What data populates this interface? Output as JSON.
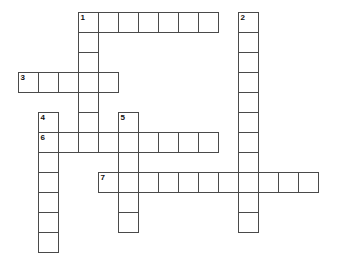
{
  "puzzle": {
    "title": "Crossword Puzzle Grid",
    "cell_size": 20,
    "origin_x": 18,
    "origin_y": 12,
    "grid_columns": 16,
    "grid_rows": 12,
    "border_color": "#4a4a4a",
    "cell_fill": "#ffffff",
    "number_color": "#111111",
    "background": "#ffffff",
    "entries": [
      {
        "number": "1",
        "direction": "across",
        "start_col": 3,
        "start_row": 0,
        "length": 7
      },
      {
        "number": "1",
        "direction": "down",
        "start_col": 3,
        "start_row": 0,
        "length": 7
      },
      {
        "number": "2",
        "direction": "down",
        "start_col": 11,
        "start_row": 0,
        "length": 11
      },
      {
        "number": "3",
        "direction": "across",
        "start_col": 0,
        "start_row": 3,
        "length": 5
      },
      {
        "number": "4",
        "direction": "down",
        "start_col": 1,
        "start_row": 5,
        "length": 7
      },
      {
        "number": "5",
        "direction": "down",
        "start_col": 5,
        "start_row": 5,
        "length": 6
      },
      {
        "number": "6",
        "direction": "across",
        "start_col": 1,
        "start_row": 6,
        "length": 9
      },
      {
        "number": "7",
        "direction": "across",
        "start_col": 4,
        "start_row": 8,
        "length": 11
      }
    ],
    "cells": [
      {
        "col": 3,
        "row": 0,
        "number": "1"
      },
      {
        "col": 4,
        "row": 0,
        "number": ""
      },
      {
        "col": 5,
        "row": 0,
        "number": ""
      },
      {
        "col": 6,
        "row": 0,
        "number": ""
      },
      {
        "col": 7,
        "row": 0,
        "number": ""
      },
      {
        "col": 8,
        "row": 0,
        "number": ""
      },
      {
        "col": 9,
        "row": 0,
        "number": ""
      },
      {
        "col": 11,
        "row": 0,
        "number": "2"
      },
      {
        "col": 3,
        "row": 1,
        "number": ""
      },
      {
        "col": 11,
        "row": 1,
        "number": ""
      },
      {
        "col": 3,
        "row": 2,
        "number": ""
      },
      {
        "col": 11,
        "row": 2,
        "number": ""
      },
      {
        "col": 0,
        "row": 3,
        "number": "3"
      },
      {
        "col": 1,
        "row": 3,
        "number": ""
      },
      {
        "col": 2,
        "row": 3,
        "number": ""
      },
      {
        "col": 3,
        "row": 3,
        "number": ""
      },
      {
        "col": 4,
        "row": 3,
        "number": ""
      },
      {
        "col": 11,
        "row": 3,
        "number": ""
      },
      {
        "col": 3,
        "row": 4,
        "number": ""
      },
      {
        "col": 11,
        "row": 4,
        "number": ""
      },
      {
        "col": 1,
        "row": 5,
        "number": "4"
      },
      {
        "col": 3,
        "row": 5,
        "number": ""
      },
      {
        "col": 5,
        "row": 5,
        "number": "5"
      },
      {
        "col": 11,
        "row": 5,
        "number": ""
      },
      {
        "col": 1,
        "row": 6,
        "number": "6"
      },
      {
        "col": 2,
        "row": 6,
        "number": ""
      },
      {
        "col": 3,
        "row": 6,
        "number": ""
      },
      {
        "col": 4,
        "row": 6,
        "number": ""
      },
      {
        "col": 5,
        "row": 6,
        "number": ""
      },
      {
        "col": 6,
        "row": 6,
        "number": ""
      },
      {
        "col": 7,
        "row": 6,
        "number": ""
      },
      {
        "col": 8,
        "row": 6,
        "number": ""
      },
      {
        "col": 9,
        "row": 6,
        "number": ""
      },
      {
        "col": 11,
        "row": 6,
        "number": ""
      },
      {
        "col": 1,
        "row": 7,
        "number": ""
      },
      {
        "col": 5,
        "row": 7,
        "number": ""
      },
      {
        "col": 11,
        "row": 7,
        "number": ""
      },
      {
        "col": 1,
        "row": 8,
        "number": ""
      },
      {
        "col": 4,
        "row": 8,
        "number": "7"
      },
      {
        "col": 5,
        "row": 8,
        "number": ""
      },
      {
        "col": 6,
        "row": 8,
        "number": ""
      },
      {
        "col": 7,
        "row": 8,
        "number": ""
      },
      {
        "col": 8,
        "row": 8,
        "number": ""
      },
      {
        "col": 9,
        "row": 8,
        "number": ""
      },
      {
        "col": 10,
        "row": 8,
        "number": ""
      },
      {
        "col": 11,
        "row": 8,
        "number": ""
      },
      {
        "col": 12,
        "row": 8,
        "number": ""
      },
      {
        "col": 13,
        "row": 8,
        "number": ""
      },
      {
        "col": 14,
        "row": 8,
        "number": ""
      },
      {
        "col": 1,
        "row": 9,
        "number": ""
      },
      {
        "col": 5,
        "row": 9,
        "number": ""
      },
      {
        "col": 11,
        "row": 9,
        "number": ""
      },
      {
        "col": 1,
        "row": 10,
        "number": ""
      },
      {
        "col": 5,
        "row": 10,
        "number": ""
      },
      {
        "col": 11,
        "row": 10,
        "number": ""
      },
      {
        "col": 1,
        "row": 11,
        "number": ""
      }
    ]
  }
}
